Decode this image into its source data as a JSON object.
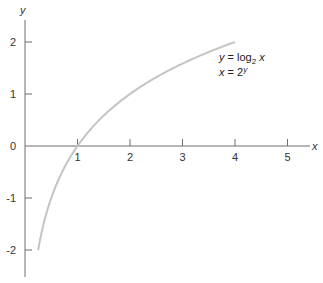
{
  "chart_data": {
    "type": "line",
    "title": "",
    "xlabel": "x",
    "ylabel": "y",
    "xlim": [
      0,
      5.4
    ],
    "ylim": [
      -2.5,
      2.45
    ],
    "x_ticks": [
      1,
      2,
      3,
      4,
      5
    ],
    "x_tick_labels": [
      "1",
      "2",
      "3",
      "4",
      "5"
    ],
    "y_ticks": [
      2,
      1,
      0,
      -1,
      -2
    ],
    "y_tick_labels": [
      "2",
      "1",
      "0",
      "-1",
      "-2"
    ],
    "grid": false,
    "series": [
      {
        "name": "y = log2 x",
        "function": "log2(x)",
        "x_range": [
          0.25,
          4
        ],
        "x": [
          0.25,
          0.5,
          1,
          2,
          3,
          4
        ],
        "values": [
          -2,
          -1,
          0,
          1,
          1.585,
          2
        ],
        "color": "#c4c4c4"
      }
    ],
    "annotations": [
      {
        "line1_prefix": "y = log",
        "line1_sub": "2",
        "line1_suffix": " x",
        "line2_prefix": "x = 2",
        "line2_sup": "y"
      }
    ]
  },
  "colors": {
    "axis": "#6e6e6e",
    "curve": "#c4c4c4",
    "text": "#333333"
  }
}
